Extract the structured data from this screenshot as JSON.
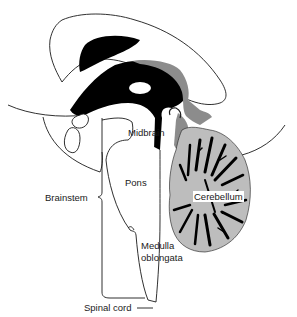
{
  "diagram": {
    "labels": {
      "midbrain": "Midbrain",
      "pons": "Pons",
      "brainstem": "Brainstem",
      "cerebellum": "Cerebellum",
      "medulla_line1": "Medulla",
      "medulla_line2": "oblongata",
      "spinal_cord": "Spinal cord"
    },
    "colors": {
      "ventricle": "#000000",
      "gray_matter": "#bdbdbd",
      "aqueduct_gray": "#8c8c8c",
      "outline": "#1a1a1a",
      "background": "#ffffff"
    }
  }
}
